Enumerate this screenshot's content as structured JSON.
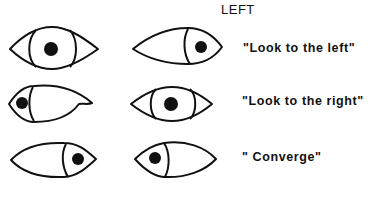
{
  "figure": {
    "header": "LEFT",
    "rows": [
      {
        "caption": "\"Look to the left\"",
        "eyes": [
          {
            "side": "left",
            "gaze": "center"
          },
          {
            "side": "right",
            "gaze": "right"
          }
        ]
      },
      {
        "caption": "\"Look to the right\"",
        "eyes": [
          {
            "side": "left",
            "gaze": "left"
          },
          {
            "side": "right",
            "gaze": "center"
          }
        ]
      },
      {
        "caption": "\" Converge\"",
        "eyes": [
          {
            "side": "left",
            "gaze": "right"
          },
          {
            "side": "right",
            "gaze": "left"
          }
        ]
      }
    ]
  }
}
